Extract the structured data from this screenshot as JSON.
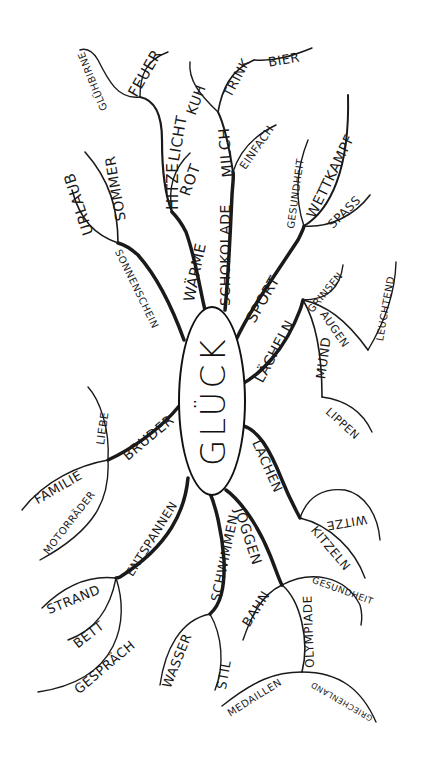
{
  "diagram": {
    "type": "mind-map",
    "language": "German",
    "center": "GLÜCK",
    "colors": {
      "ink": "#1a1a1a",
      "background": "#ffffff"
    },
    "branches": [
      {
        "label": "SONNENSCHEIN",
        "children": [
          {
            "label": "URLAUB"
          },
          {
            "label": "SOMMER"
          }
        ]
      },
      {
        "label": "WÄRME",
        "children": [
          {
            "label": "HITZE",
            "children": []
          },
          {
            "label": "LICHT",
            "children": [
              {
                "label": "GLÜHBIRNE"
              },
              {
                "label": "FEUER"
              }
            ]
          },
          {
            "label": "ROT"
          }
        ]
      },
      {
        "label": "SCHOKOLADE",
        "children": [
          {
            "label": "MILCH",
            "children": [
              {
                "label": "KUH"
              },
              {
                "label": "TRINK",
                "children": [
                  {
                    "label": "BIER"
                  }
                ]
              }
            ]
          },
          {
            "label": "EINFACH"
          }
        ]
      },
      {
        "label": "SPORT",
        "children": [
          {
            "label": "GESUNDHEIT"
          },
          {
            "label": "WETTKAMPF"
          },
          {
            "label": "SPASS"
          }
        ]
      },
      {
        "label": "LÄCHELN",
        "children": [
          {
            "label": "GRINSEN"
          },
          {
            "label": "AUGEN",
            "children": [
              {
                "label": "LEUCHTEND"
              }
            ]
          },
          {
            "label": "MUND",
            "children": [
              {
                "label": "LIPPEN"
              }
            ]
          }
        ]
      },
      {
        "label": "LACHEN",
        "children": [
          {
            "label": "WITZE"
          },
          {
            "label": "KITZELN"
          }
        ]
      },
      {
        "label": "JOGGEN",
        "children": [
          {
            "label": "BAHN"
          },
          {
            "label": "OLYMPIADE",
            "children": [
              {
                "label": "MEDAILLEN"
              },
              {
                "label": "GRIECHENLAND"
              }
            ]
          },
          {
            "label": "GESUNDHEIT"
          }
        ]
      },
      {
        "label": "SCHWIMMEN",
        "children": [
          {
            "label": "WASSER"
          },
          {
            "label": "STIL"
          }
        ]
      },
      {
        "label": "ENTSPANNEN",
        "children": [
          {
            "label": "STRAND"
          },
          {
            "label": "BETT"
          },
          {
            "label": "GESPRÄCH"
          }
        ]
      },
      {
        "label": "BRUDER",
        "children": [
          {
            "label": "LIEBE"
          },
          {
            "label": "FAMILIE"
          },
          {
            "label": "MOTORRÄDER"
          }
        ]
      }
    ]
  },
  "labels": {
    "center": "GLÜCK",
    "sonnenschein": "SONNENSCHEIN",
    "urlaub": "URLAUB",
    "sommer": "SOMMER",
    "waerme": "WÄRME",
    "hitze": "HITZE",
    "licht": "LICHT",
    "gluehbirne": "GLÜHBIRNE",
    "feuer": "FEUER",
    "rot": "ROT",
    "schokolade": "SCHOKOLADE",
    "milch": "MILCH",
    "kuh": "KUH",
    "trink": "TRINK",
    "bier": "BIER",
    "einfach": "EINFACH",
    "sport": "SPORT",
    "gesundheit_sport": "GESUNDHEIT",
    "wettkampf": "WETTKAMPF",
    "spass": "SPASS",
    "laecheln": "LÄCHELN",
    "grinsen": "GRINSEN",
    "augen": "AUGEN",
    "leuchtend": "LEUCHTEND",
    "mund": "MUND",
    "lippen": "LIPPEN",
    "lachen": "LACHEN",
    "witze": "WITZE",
    "kitzeln": "KITZELN",
    "joggen": "JOGGEN",
    "bahn": "BAHN",
    "olympiade": "OLYMPIADE",
    "medaillen": "MEDAILLEN",
    "griechenland": "GRIECHENLAND",
    "gesundheit_joggen": "GESUNDHEIT",
    "schwimmen": "SCHWIMMEN",
    "wasser": "WASSER",
    "stil": "STIL",
    "entspannen": "ENTSPANNEN",
    "strand": "STRAND",
    "bett": "BETT",
    "gespraech": "GESPRÄCH",
    "bruder": "BRUDER",
    "liebe": "LIEBE",
    "familie": "FAMILIE",
    "motorraeder": "MOTORRÄDER"
  }
}
